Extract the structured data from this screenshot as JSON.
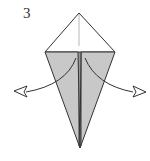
{
  "diagram": {
    "step_number": "3",
    "colors": {
      "fill": "#c8c8c8",
      "stroke": "#333333",
      "background": "#ffffff"
    },
    "arrows": [
      "left-outward-arrow",
      "right-outward-arrow"
    ]
  }
}
